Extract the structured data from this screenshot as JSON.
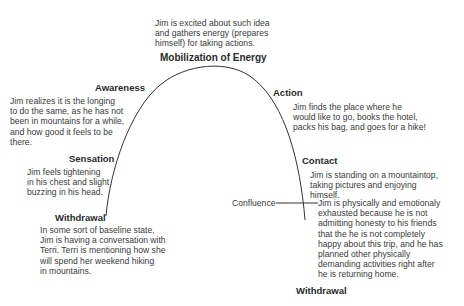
{
  "diagram": {
    "stages": [
      {
        "id": "withdrawal-start",
        "heading": "Withdrawal",
        "lines": [
          "In some sort of baseline state,",
          "Jim is having a conversation with",
          "Terri. Terri is mentioning how she",
          "will spend her weekend hiking",
          "in mountains."
        ]
      },
      {
        "id": "sensation",
        "heading": "Sensation",
        "lines": [
          "Jim feels tightening",
          "in his chest and slight",
          "buzzing in his head."
        ]
      },
      {
        "id": "awareness",
        "heading": "Awareness",
        "lines": [
          "Jim realizes it is the longing",
          "to do the same, as he has not",
          "been in mountains for a while,",
          "and how good it feels to be",
          "there."
        ]
      },
      {
        "id": "mobilization",
        "heading": "Mobilization of Energy",
        "lines": [
          "Jim is excited about such idea",
          "and gathers energy (prepares",
          "himself) for taking actions."
        ]
      },
      {
        "id": "action",
        "heading": "Action",
        "lines": [
          "Jim finds the place where he",
          "would like to go, books the hotel,",
          "packs his bag, and goes for a hike!"
        ]
      },
      {
        "id": "contact",
        "heading": "Contact",
        "lines": [
          "Jim is standing on a mountaintop,",
          "taking pictures and enjoying",
          "himself."
        ]
      },
      {
        "id": "withdrawal-end",
        "heading": "Withdrawal",
        "lines": [
          "Jim is physically and emotionaly",
          "exhausted because he is not",
          "admitting honesty to his friends",
          "that the he is not completely",
          "happy about this trip, and he has",
          "planned other physically",
          "demanding activities right after",
          "he is returning home."
        ]
      }
    ],
    "confluence_label": "Confluence",
    "line_color": "#333333"
  }
}
